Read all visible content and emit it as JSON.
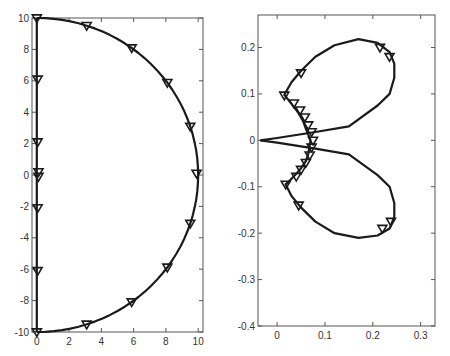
{
  "chart_data": [
    {
      "type": "line",
      "title": "",
      "xlabel": "",
      "ylabel": "",
      "xlim": [
        -0.3,
        10.3
      ],
      "ylim": [
        -10,
        10
      ],
      "grid": false,
      "legend": null,
      "xticks": [
        0,
        2,
        4,
        6,
        8,
        10
      ],
      "yticks": [
        -10,
        -8,
        -6,
        -4,
        -2,
        0,
        2,
        4,
        6,
        8,
        10
      ],
      "xtick_labels": [
        "0",
        "2",
        "4",
        "6",
        "8",
        "10"
      ],
      "ytick_labels": [
        "-10",
        "-8",
        "-6",
        "-4",
        "-2",
        "0",
        "2",
        "4",
        "6",
        "8",
        "10"
      ],
      "series": [
        {
          "name": "semicircle contour",
          "x": [
            0,
            3.09,
            5.88,
            8.09,
            9.51,
            10,
            9.51,
            8.09,
            5.88,
            3.09,
            0
          ],
          "y": [
            10,
            9.51,
            8.09,
            5.88,
            3.09,
            0,
            -3.09,
            -5.88,
            -8.09,
            -9.51,
            -10
          ],
          "markers": [
            {
              "x": 3.09,
              "y": 9.51
            },
            {
              "x": 5.88,
              "y": 8.09
            },
            {
              "x": 8.09,
              "y": 5.88
            },
            {
              "x": 9.51,
              "y": 3.09
            },
            {
              "x": 9.9,
              "y": 0.1
            },
            {
              "x": 9.51,
              "y": -3.09
            },
            {
              "x": 8.09,
              "y": -5.88
            },
            {
              "x": 5.88,
              "y": -8.09
            },
            {
              "x": 3.09,
              "y": -9.51
            }
          ]
        },
        {
          "name": "imaginary axis",
          "x": [
            0,
            0
          ],
          "y": [
            -10,
            10
          ],
          "markers": [
            {
              "x": 0,
              "y": 10
            },
            {
              "x": 0.05,
              "y": 6.1
            },
            {
              "x": 0.05,
              "y": 2.1
            },
            {
              "x": 0.1,
              "y": 0.2
            },
            {
              "x": 0.1,
              "y": -0.1
            },
            {
              "x": 0.05,
              "y": -2.1
            },
            {
              "x": 0.05,
              "y": -6.1
            },
            {
              "x": 0,
              "y": -10
            }
          ]
        }
      ]
    },
    {
      "type": "line",
      "title": "",
      "xlabel": "",
      "ylabel": "",
      "xlim": [
        -0.04,
        0.33
      ],
      "ylim": [
        -0.4,
        0.27
      ],
      "grid": false,
      "legend": null,
      "xticks": [
        0,
        0.1,
        0.2,
        0.3
      ],
      "yticks": [
        -0.4,
        -0.3,
        -0.2,
        -0.1,
        0,
        0.1,
        0.2
      ],
      "xtick_labels": [
        "0",
        "0.1",
        "0.2",
        "0.3"
      ],
      "ytick_labels": [
        "-0.4",
        "-0.3",
        "-0.2",
        "-0.1",
        "0",
        "0.1",
        "0.2"
      ],
      "series": [
        {
          "name": "upper lobe",
          "x": [
            0.07,
            0.06,
            0.055,
            0.045,
            0.035,
            0.025,
            0.015,
            0.03,
            0.05,
            0.08,
            0.12,
            0.17,
            0.21,
            0.235,
            0.245,
            0.245,
            0.235,
            0.21,
            0.15,
            0.08,
            0.0,
            -0.035
          ],
          "y": [
            0.0,
            0.025,
            0.04,
            0.058,
            0.072,
            0.085,
            0.098,
            0.125,
            0.15,
            0.18,
            0.205,
            0.218,
            0.21,
            0.19,
            0.165,
            0.135,
            0.1,
            0.075,
            0.03,
            0.018,
            0.005,
            0.0
          ],
          "markers": [
            {
              "x": 0.215,
              "y": 0.2
            },
            {
              "x": 0.235,
              "y": 0.18
            },
            {
              "x": 0.05,
              "y": 0.145
            },
            {
              "x": 0.015,
              "y": 0.097
            },
            {
              "x": 0.035,
              "y": 0.08
            },
            {
              "x": 0.048,
              "y": 0.065
            },
            {
              "x": 0.058,
              "y": 0.05
            },
            {
              "x": 0.065,
              "y": 0.033
            },
            {
              "x": 0.072,
              "y": 0.018
            },
            {
              "x": 0.075,
              "y": 0.0
            }
          ]
        },
        {
          "name": "lower lobe",
          "x": [
            0.07,
            0.065,
            0.06,
            0.05,
            0.04,
            0.028,
            0.018,
            0.03,
            0.05,
            0.08,
            0.12,
            0.17,
            0.21,
            0.235,
            0.245,
            0.245,
            0.235,
            0.21,
            0.15,
            0.08,
            0.0,
            -0.035
          ],
          "y": [
            0.0,
            -0.03,
            -0.045,
            -0.06,
            -0.072,
            -0.085,
            -0.095,
            -0.12,
            -0.145,
            -0.175,
            -0.2,
            -0.21,
            -0.205,
            -0.19,
            -0.165,
            -0.135,
            -0.1,
            -0.075,
            -0.03,
            -0.018,
            -0.005,
            0.0
          ],
          "markers": [
            {
              "x": 0.072,
              "y": -0.015
            },
            {
              "x": 0.068,
              "y": -0.032
            },
            {
              "x": 0.06,
              "y": -0.048
            },
            {
              "x": 0.05,
              "y": -0.063
            },
            {
              "x": 0.04,
              "y": -0.078
            },
            {
              "x": 0.018,
              "y": -0.095
            },
            {
              "x": 0.045,
              "y": -0.14
            },
            {
              "x": 0.22,
              "y": -0.19
            },
            {
              "x": 0.238,
              "y": -0.175
            }
          ]
        }
      ]
    }
  ],
  "figure": {
    "axes": [
      {
        "frame": {
          "left": 32,
          "top": 18,
          "right": 203,
          "bottom": 332
        }
      },
      {
        "frame": {
          "left": 258,
          "top": 15,
          "right": 435,
          "bottom": 326
        }
      }
    ],
    "line_color": "#1a1a1a",
    "axis_color": "#555555"
  }
}
